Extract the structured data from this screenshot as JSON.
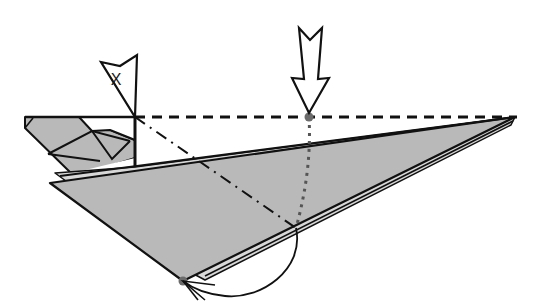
{
  "diagram": {
    "type": "origami-fold-instruction",
    "colors": {
      "paper_gray": "#b9b9b9",
      "paper_white": "#ffffff",
      "line": "#111111",
      "reference_dot": "#6b6b6b"
    },
    "pointer_arrow": {
      "label": "X",
      "meaning": "reference point"
    },
    "push_arrow": {
      "direction": "down",
      "meaning": "fold here"
    },
    "lines": {
      "valley_fold": "dashed horizontal line along top edge",
      "mountain_fold": "dash-dot diagonal line",
      "guide": "dotted vertical line from reference point"
    },
    "motion": "curved arrow swinging corner to meet the reference point"
  }
}
